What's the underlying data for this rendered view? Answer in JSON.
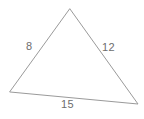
{
  "figure": {
    "name": "triangle-side-lengths",
    "background_color": "#ffffff",
    "stroke_color": "#9a9a9a",
    "text_color": "#6d6d6d",
    "stroke_width": 1,
    "width": 144,
    "height": 119
  },
  "shape": {
    "type": "triangle",
    "classification": "scalene",
    "vertices": [
      {
        "name": "apex",
        "x": 70,
        "y": 9
      },
      {
        "name": "bottom-right",
        "x": 138,
        "y": 104
      },
      {
        "name": "bottom-left",
        "x": 10,
        "y": 92
      }
    ],
    "points_attr": "70,9 138,104 10,92"
  },
  "labels": {
    "side_a": "8",
    "side_b": "12",
    "side_c": "15"
  },
  "chart_data": {
    "type": "diagram",
    "title": "",
    "categories": [
      "left side",
      "right side",
      "bottom side"
    ],
    "values": [
      8,
      12,
      15
    ],
    "annotations": [
      {
        "text": "8",
        "side": "left",
        "from": "bottom-left",
        "to": "apex",
        "x": 30,
        "y": 46
      },
      {
        "text": "12",
        "side": "right",
        "from": "apex",
        "to": "bottom-right",
        "x": 109,
        "y": 47
      },
      {
        "text": "15",
        "side": "bottom",
        "from": "bottom-left",
        "to": "bottom-right",
        "x": 69,
        "y": 104
      }
    ]
  }
}
